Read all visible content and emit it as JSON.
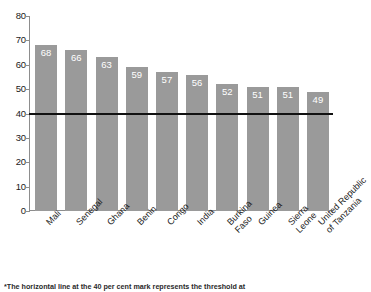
{
  "figure": {
    "top_clipped_text": "",
    "footnote": "*The horizontal line at the 40 per cent mark represents the threshold at"
  },
  "chart_data": {
    "type": "bar",
    "title": "",
    "subtitle": "",
    "xlabel": "",
    "ylabel": "",
    "ylim": [
      0,
      80
    ],
    "ytick_step": 10,
    "ytick_labels": [
      "80",
      "70",
      "60",
      "50",
      "40",
      "30",
      "20",
      "10",
      "0"
    ],
    "grid": false,
    "legend": null,
    "bar_color": "#9a9a9a",
    "value_label_color": "#ffffff",
    "categories": [
      "Mali",
      "Senegal",
      "Ghana",
      "Benin",
      "Congo",
      "India",
      "Burkina Faso",
      "Guinea",
      "Sierra Leone",
      "United Republic of Tanzania"
    ],
    "category_lines": [
      [
        "Mali"
      ],
      [
        "Senegal"
      ],
      [
        "Ghana"
      ],
      [
        "Benin"
      ],
      [
        "Congo"
      ],
      [
        "India"
      ],
      [
        "Burkina",
        "Faso"
      ],
      [
        "Guinea"
      ],
      [
        "Sierra",
        "Leone"
      ],
      [
        "United Republic",
        "of Tanzania"
      ]
    ],
    "values": [
      68,
      66,
      63,
      59,
      57,
      56,
      52,
      51,
      51,
      49
    ],
    "annotations": [
      {
        "type": "hline",
        "value": 40,
        "color": "#111111",
        "label": "40 per cent threshold"
      }
    ]
  }
}
